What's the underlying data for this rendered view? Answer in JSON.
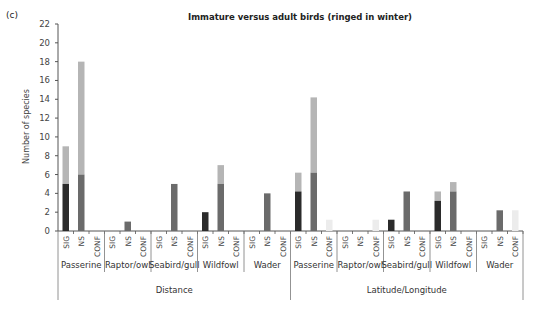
{
  "panel_label": "(c)",
  "title": "Immature versus adult birds (ringed in winter)",
  "ylabel": "Number of species",
  "colors": {
    "sig_dark": "#2b2b2b",
    "ns_dark": "#6b6b6b",
    "upper_light": "#b5b5b5",
    "conf_faint": "#ececec",
    "axis": "#555555"
  },
  "chart_data": {
    "type": "bar",
    "stacked": true,
    "title": "Immature versus adult birds (ringed in winter)",
    "panel_label": "(c)",
    "xlabel": "",
    "ylabel": "Number of species",
    "ylim": [
      0,
      22
    ],
    "yticks": [
      0,
      2,
      4,
      6,
      8,
      10,
      12,
      14,
      16,
      18,
      20,
      22
    ],
    "grid": false,
    "legend": null,
    "method_groups": [
      "Distance",
      "Latitude/Longitude"
    ],
    "bird_groups": [
      "Passerine",
      "Raptor/owl",
      "Seabird/gull",
      "Wildfowl",
      "Wader"
    ],
    "sub_categories": [
      "SIG",
      "NS",
      "CONF"
    ],
    "bars": [
      {
        "method": "Distance",
        "group": "Passerine",
        "sub": "SIG",
        "lower": 5,
        "total": 9
      },
      {
        "method": "Distance",
        "group": "Passerine",
        "sub": "NS",
        "lower": 6,
        "total": 18
      },
      {
        "method": "Distance",
        "group": "Passerine",
        "sub": "CONF",
        "lower": 0,
        "total": 0
      },
      {
        "method": "Distance",
        "group": "Raptor/owl",
        "sub": "SIG",
        "lower": 0,
        "total": 0
      },
      {
        "method": "Distance",
        "group": "Raptor/owl",
        "sub": "NS",
        "lower": 1,
        "total": 1
      },
      {
        "method": "Distance",
        "group": "Raptor/owl",
        "sub": "CONF",
        "lower": 0,
        "total": 0
      },
      {
        "method": "Distance",
        "group": "Seabird/gull",
        "sub": "SIG",
        "lower": 0,
        "total": 0
      },
      {
        "method": "Distance",
        "group": "Seabird/gull",
        "sub": "NS",
        "lower": 5,
        "total": 5
      },
      {
        "method": "Distance",
        "group": "Seabird/gull",
        "sub": "CONF",
        "lower": 0,
        "total": 0
      },
      {
        "method": "Distance",
        "group": "Wildfowl",
        "sub": "SIG",
        "lower": 2,
        "total": 2
      },
      {
        "method": "Distance",
        "group": "Wildfowl",
        "sub": "NS",
        "lower": 5,
        "total": 7
      },
      {
        "method": "Distance",
        "group": "Wildfowl",
        "sub": "CONF",
        "lower": 0,
        "total": 0
      },
      {
        "method": "Distance",
        "group": "Wader",
        "sub": "SIG",
        "lower": 0,
        "total": 0
      },
      {
        "method": "Distance",
        "group": "Wader",
        "sub": "NS",
        "lower": 4,
        "total": 4
      },
      {
        "method": "Distance",
        "group": "Wader",
        "sub": "CONF",
        "lower": 0,
        "total": 0
      },
      {
        "method": "Latitude/Longitude",
        "group": "Passerine",
        "sub": "SIG",
        "lower": 4.2,
        "total": 6.2
      },
      {
        "method": "Latitude/Longitude",
        "group": "Passerine",
        "sub": "NS",
        "lower": 6.2,
        "total": 14.2
      },
      {
        "method": "Latitude/Longitude",
        "group": "Passerine",
        "sub": "CONF",
        "lower": 0,
        "total": 1.2,
        "faint": true
      },
      {
        "method": "Latitude/Longitude",
        "group": "Raptor/owl",
        "sub": "SIG",
        "lower": 0,
        "total": 0
      },
      {
        "method": "Latitude/Longitude",
        "group": "Raptor/owl",
        "sub": "NS",
        "lower": 0,
        "total": 0
      },
      {
        "method": "Latitude/Longitude",
        "group": "Raptor/owl",
        "sub": "CONF",
        "lower": 0,
        "total": 1.2,
        "faint": true
      },
      {
        "method": "Latitude/Longitude",
        "group": "Seabird/gull",
        "sub": "SIG",
        "lower": 1.2,
        "total": 1.2
      },
      {
        "method": "Latitude/Longitude",
        "group": "Seabird/gull",
        "sub": "NS",
        "lower": 4.2,
        "total": 4.2
      },
      {
        "method": "Latitude/Longitude",
        "group": "Seabird/gull",
        "sub": "CONF",
        "lower": 0,
        "total": 0
      },
      {
        "method": "Latitude/Longitude",
        "group": "Wildfowl",
        "sub": "SIG",
        "lower": 3.2,
        "total": 4.2
      },
      {
        "method": "Latitude/Longitude",
        "group": "Wildfowl",
        "sub": "NS",
        "lower": 4.2,
        "total": 5.2
      },
      {
        "method": "Latitude/Longitude",
        "group": "Wildfowl",
        "sub": "CONF",
        "lower": 0,
        "total": 0
      },
      {
        "method": "Latitude/Longitude",
        "group": "Wader",
        "sub": "SIG",
        "lower": 0,
        "total": 0
      },
      {
        "method": "Latitude/Longitude",
        "group": "Wader",
        "sub": "NS",
        "lower": 2.2,
        "total": 2.2
      },
      {
        "method": "Latitude/Longitude",
        "group": "Wader",
        "sub": "CONF",
        "lower": 0,
        "total": 2.2,
        "faint": true
      }
    ]
  }
}
